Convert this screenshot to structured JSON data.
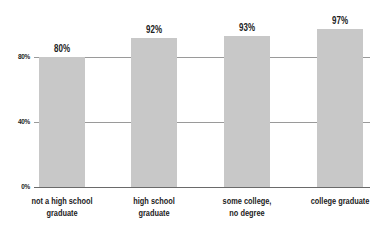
{
  "chart_data": {
    "type": "bar",
    "title": "",
    "xlabel": "",
    "ylabel": "",
    "categories": [
      "not a high school\ngraduate",
      "high school\ngraduate",
      "some college,\nno degree",
      "college graduate"
    ],
    "values": [
      80,
      92,
      93,
      97
    ],
    "value_labels": [
      "80%",
      "92%",
      "93%",
      "97%"
    ],
    "ylim": [
      0,
      100
    ],
    "yticks": [
      0,
      40,
      80
    ],
    "ytick_labels": [
      "0%",
      "40%",
      "80%"
    ],
    "grid": true,
    "legend": null,
    "bar_color": "#c8c8c8",
    "grid_color": "#9a9a9a"
  }
}
